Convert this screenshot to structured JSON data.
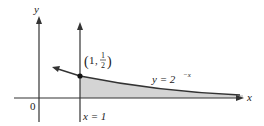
{
  "diagram": {
    "type": "function-graph",
    "axes": {
      "x_label": "x",
      "y_label": "y",
      "origin_label": "0"
    },
    "curve": {
      "equation_label": "y = 2",
      "equation_exponent": "−x",
      "point_label": "(1, ½)",
      "point_label_num": "1",
      "point_label_frac_num": "1",
      "point_label_frac_den": "2"
    },
    "vertical_line": {
      "label": "x = 1"
    },
    "shaded_region": "area under y = 2^-x for x ≥ 1",
    "colors": {
      "line": "#333333",
      "shade": "#d4d4d4"
    }
  }
}
